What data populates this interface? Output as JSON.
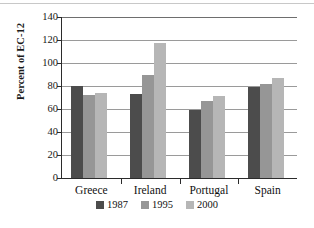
{
  "chart_data": {
    "type": "bar",
    "title": "",
    "subtitle": "",
    "xlabel": "",
    "ylabel": "Percent of EC-12",
    "categories": [
      "Greece",
      "Ireland",
      "Portugal",
      "Spain"
    ],
    "series": [
      {
        "name": "1987",
        "color": "#4c4c4c",
        "values": [
          80,
          73,
          59,
          79
        ]
      },
      {
        "name": "1995",
        "color": "#969696",
        "values": [
          72.5,
          90,
          67,
          82
        ]
      },
      {
        "name": "2000",
        "color": "#b6b6b6",
        "values": [
          73.5,
          117,
          71,
          87
        ]
      }
    ],
    "ylim": [
      0,
      140
    ],
    "ytick_step": 20,
    "yticks": [
      140,
      120,
      100,
      80,
      60,
      40,
      20,
      0
    ],
    "ytick_labels": [
      "140",
      "120",
      "100",
      "80",
      "60",
      "40",
      "20",
      "0"
    ],
    "grid": true,
    "grid_axis": "y",
    "legend_position": "bottom",
    "legend_entries": [
      "1987",
      "1995",
      "2000"
    ]
  },
  "axis": {
    "y_title": "Percent of EC-12"
  },
  "colors": {
    "series_1987": "#4c4c4c",
    "series_1995": "#969696",
    "series_2000": "#b6b6b6",
    "grid": "#9a9a9a",
    "axis": "#2b2b2b",
    "background": "#ffffff"
  }
}
